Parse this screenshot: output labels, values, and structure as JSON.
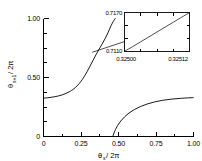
{
  "chart_data": {
    "type": "line",
    "title": "",
    "xlabel": "θs / 2π",
    "ylabel": "θs+1 / 2π",
    "xlim": [
      0,
      1
    ],
    "ylim": [
      0,
      1
    ],
    "grid": false,
    "legend": "none",
    "xticks": [
      0,
      0.25,
      0.5,
      0.75,
      1
    ],
    "yticks": [
      0,
      0.5,
      1
    ],
    "xtick_labels": [
      "0",
      "0.25",
      "0.50",
      "0.75",
      "1.00"
    ],
    "ytick_labels": [
      "0",
      "0.50",
      "1.00"
    ],
    "xminor_ticks": [
      0.125,
      0.375,
      0.625,
      0.875
    ],
    "yminor_ticks": [
      0.125,
      0.25,
      0.375,
      0.625,
      0.75,
      0.875
    ],
    "series": [
      {
        "name": "upper-branch",
        "comment": "rising sigmoid branch from left edge to top",
        "x": [
          0.0,
          0.025,
          0.05,
          0.075,
          0.1,
          0.125,
          0.15,
          0.175,
          0.2,
          0.225,
          0.25,
          0.27,
          0.29,
          0.31,
          0.33,
          0.35,
          0.37,
          0.39,
          0.41,
          0.43,
          0.45,
          0.465,
          0.478
        ],
        "y": [
          0.325,
          0.328,
          0.332,
          0.337,
          0.344,
          0.353,
          0.365,
          0.381,
          0.402,
          0.43,
          0.468,
          0.505,
          0.548,
          0.596,
          0.645,
          0.693,
          0.738,
          0.782,
          0.828,
          0.88,
          0.938,
          0.975,
          1.0
        ]
      },
      {
        "name": "lower-branch",
        "comment": "rising branch from x-axis near 0.46 up to right edge",
        "x": [
          0.462,
          0.47,
          0.48,
          0.495,
          0.515,
          0.54,
          0.57,
          0.605,
          0.645,
          0.69,
          0.74,
          0.795,
          0.855,
          0.92,
          0.99,
          1.0
        ],
        "y": [
          0.0,
          0.03,
          0.06,
          0.095,
          0.131,
          0.166,
          0.199,
          0.228,
          0.253,
          0.275,
          0.293,
          0.307,
          0.317,
          0.324,
          0.329,
          0.33
        ]
      }
    ],
    "annotations": [
      {
        "name": "inset-leader",
        "comment": "line pointing from magnified region of main curve to inset box",
        "from_x": 0.325,
        "from_y": 0.714,
        "to_x": 0.565,
        "to_y": 0.815
      }
    ],
    "inset": {
      "type": "line",
      "comment": "magnification of the main curve around theta_s/2pi = 0.325",
      "xlim": [
        0.325,
        0.32512
      ],
      "ylim": [
        0.711,
        0.717
      ],
      "xtick_labels": [
        "0.32500",
        "0.32512"
      ],
      "ytick_labels": [
        "0.7110",
        "0.7170"
      ],
      "xticks": [
        0.325,
        0.32512
      ],
      "yticks": [
        0.711,
        0.717
      ],
      "grid": false,
      "series": [
        {
          "name": "magnified-branch",
          "comment": "near-linear ascending segment spanning the inset box",
          "x": [
            0.325,
            0.325015,
            0.32503,
            0.325045,
            0.32506,
            0.325075,
            0.32509,
            0.325105,
            0.32512
          ],
          "y": [
            0.71103,
            0.71175,
            0.7125,
            0.71325,
            0.714,
            0.71475,
            0.7155,
            0.71625,
            0.71697
          ]
        }
      ]
    }
  },
  "labels": {
    "x_axis_main": "θ",
    "x_axis_sub": "s",
    "x_axis_tail": " / 2π",
    "y_axis_main": "θ",
    "y_axis_sub": "s+1",
    "y_axis_tail": " / 2π"
  },
  "colors": {
    "background": "#ffffff",
    "ink": "#000000"
  }
}
